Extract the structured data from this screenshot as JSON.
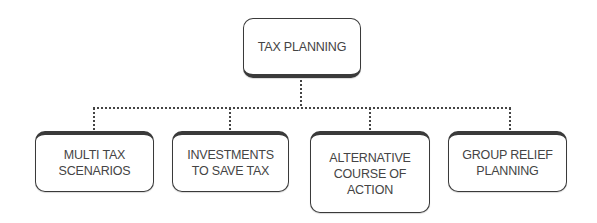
{
  "diagram": {
    "type": "org-chart",
    "root": {
      "label": "TAX PLANNING"
    },
    "children": [
      {
        "label": "MULTI TAX\nSCENARIOS"
      },
      {
        "label": "INVESTMENTS\nTO SAVE TAX"
      },
      {
        "label": "ALTERNATIVE\nCOURSE OF\nACTION"
      },
      {
        "label": "GROUP RELIEF\nPLANNING"
      }
    ],
    "connector_style": "dotted",
    "colors": {
      "border": "#3a3a3a",
      "text": "#444444",
      "background": "#ffffff"
    }
  }
}
